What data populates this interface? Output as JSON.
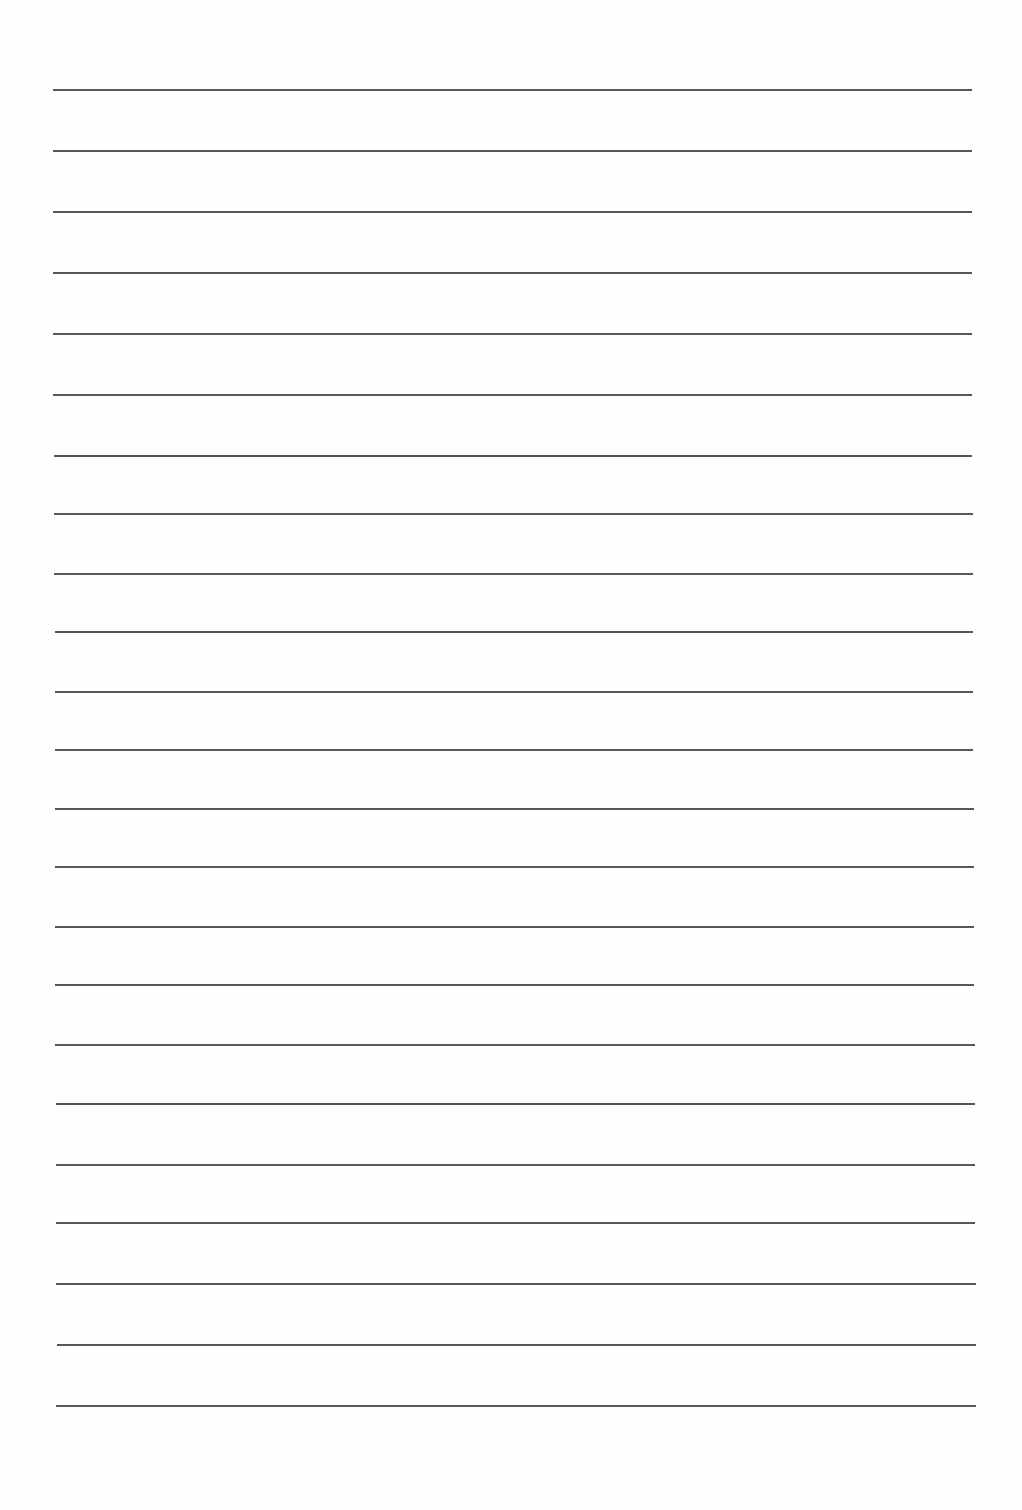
{
  "page": {
    "type": "lined-paper",
    "background_color": "#fefefe",
    "line_color": "#3a3a3a",
    "line_count": 23,
    "lines": [
      {
        "y": 90,
        "x1": 53,
        "x2": 972
      },
      {
        "y": 151,
        "x1": 53,
        "x2": 972
      },
      {
        "y": 212,
        "x1": 53,
        "x2": 972
      },
      {
        "y": 273,
        "x1": 53,
        "x2": 972
      },
      {
        "y": 334,
        "x1": 53,
        "x2": 972
      },
      {
        "y": 395,
        "x1": 53,
        "x2": 972
      },
      {
        "y": 456,
        "x1": 54,
        "x2": 972
      },
      {
        "y": 514,
        "x1": 54,
        "x2": 973
      },
      {
        "y": 574,
        "x1": 54,
        "x2": 973
      },
      {
        "y": 632,
        "x1": 55,
        "x2": 973
      },
      {
        "y": 692,
        "x1": 55,
        "x2": 973
      },
      {
        "y": 750,
        "x1": 55,
        "x2": 973
      },
      {
        "y": 809,
        "x1": 55,
        "x2": 974
      },
      {
        "y": 867,
        "x1": 55,
        "x2": 974
      },
      {
        "y": 927,
        "x1": 55,
        "x2": 974
      },
      {
        "y": 985,
        "x1": 55,
        "x2": 974
      },
      {
        "y": 1045,
        "x1": 55,
        "x2": 975
      },
      {
        "y": 1104,
        "x1": 56,
        "x2": 975
      },
      {
        "y": 1165,
        "x1": 56,
        "x2": 975
      },
      {
        "y": 1223,
        "x1": 56,
        "x2": 975
      },
      {
        "y": 1284,
        "x1": 56,
        "x2": 976
      },
      {
        "y": 1345,
        "x1": 57,
        "x2": 976
      },
      {
        "y": 1406,
        "x1": 56,
        "x2": 976
      }
    ]
  }
}
